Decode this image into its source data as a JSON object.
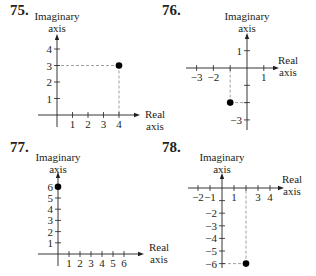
{
  "chart_data": [
    {
      "type": "scatter",
      "number": "75.",
      "title": "",
      "xlabel": "Real axis",
      "ylabel": "Imaginary axis",
      "x_ticks": [
        1,
        2,
        3,
        4
      ],
      "y_ticks": [
        1,
        2,
        3,
        4
      ],
      "x_tick_labels": [
        "1",
        "2",
        "3",
        "4"
      ],
      "y_tick_labels": [
        "1",
        "2",
        "3",
        "4"
      ],
      "xlim": [
        0,
        4.5
      ],
      "ylim": [
        0,
        4.5
      ],
      "points": [
        {
          "x": 4,
          "y": 3
        }
      ],
      "guides": true,
      "grid": false
    },
    {
      "type": "scatter",
      "number": "76.",
      "title": "",
      "xlabel": "Real axis",
      "ylabel": "Imaginary axis",
      "x_ticks": [
        -3,
        -2,
        -1,
        1
      ],
      "y_ticks": [
        1,
        -1,
        -2,
        -3
      ],
      "x_tick_labels": [
        "−3",
        "−2",
        "",
        "1"
      ],
      "y_tick_labels": [
        "1",
        "",
        "",
        "−3"
      ],
      "xlim": [
        -3.5,
        1.5
      ],
      "ylim": [
        -3.5,
        1.5
      ],
      "points": [
        {
          "x": -1,
          "y": -2
        }
      ],
      "guides": true,
      "grid": false
    },
    {
      "type": "scatter",
      "number": "77.",
      "title": "",
      "xlabel": "Real axis",
      "ylabel": "Imaginary axis",
      "x_ticks": [
        1,
        2,
        3,
        4,
        5,
        6
      ],
      "y_ticks": [
        1,
        2,
        3,
        4,
        5,
        6
      ],
      "x_tick_labels": [
        "1",
        "2",
        "3",
        "4",
        "5",
        "6"
      ],
      "y_tick_labels": [
        "1",
        "2",
        "3",
        "4",
        "5",
        "6"
      ],
      "xlim": [
        0,
        6.5
      ],
      "ylim": [
        0,
        6.5
      ],
      "points": [
        {
          "x": 0,
          "y": 6
        }
      ],
      "guides": false,
      "grid": false
    },
    {
      "type": "scatter",
      "number": "78.",
      "title": "",
      "xlabel": "Real axis",
      "ylabel": "Imaginary axis",
      "x_ticks": [
        -2,
        -1,
        1,
        2,
        3,
        4
      ],
      "y_ticks": [
        -1,
        -2,
        -3,
        -4,
        -5,
        -6
      ],
      "x_tick_labels": [
        "−2",
        "−1",
        "1",
        "",
        "3",
        "4"
      ],
      "y_tick_labels": [
        "",
        "−2",
        "−3",
        "−4",
        "−5",
        "−6"
      ],
      "xlim": [
        -2.5,
        4.5
      ],
      "ylim": [
        -6.5,
        0.5
      ],
      "points": [
        {
          "x": 2,
          "y": -6
        }
      ],
      "guides": true,
      "grid": false
    }
  ],
  "panels": [
    {
      "number": "75.",
      "ylabel_line1": "Imaginary",
      "ylabel_line2": "axis",
      "xlabel_line1": "Real",
      "xlabel_line2": "axis"
    },
    {
      "number": "76.",
      "ylabel_line1": "Imaginary",
      "ylabel_line2": "axis",
      "xlabel_line1": "Real",
      "xlabel_line2": "axis"
    },
    {
      "number": "77.",
      "ylabel_line1": "Imaginary",
      "ylabel_line2": "axis",
      "xlabel_line1": "Real",
      "xlabel_line2": "axis"
    },
    {
      "number": "78.",
      "ylabel_line1": "Imaginary",
      "ylabel_line2": "axis",
      "xlabel_line1": "Real",
      "xlabel_line2": "axis"
    }
  ],
  "layout": [
    {
      "ox": 57,
      "oy": 115,
      "sx": 15.5,
      "sy": 16.5,
      "num_x": 10,
      "num_y": 4,
      "ylab_x": 57,
      "ylab_y": 22,
      "xlab_x": 145,
      "xlab_y": 118,
      "xmin_px": 38,
      "xmax_px": 136,
      "ymin_px": 127,
      "ymax_px": 38
    },
    {
      "ox": 247,
      "oy": 68,
      "sx": 16.8,
      "sy": 17.3,
      "num_x": 162,
      "num_y": 4,
      "ylab_x": 247,
      "ylab_y": 22,
      "xlab_x": 278,
      "xlab_y": 64,
      "xmin_px": 186,
      "xmax_px": 275,
      "ymin_px": 130,
      "ymax_px": 37
    },
    {
      "ox": 58,
      "oy": 254,
      "sx": 11.0,
      "sy": 11.2,
      "num_x": 10,
      "num_y": 140,
      "ylab_x": 58,
      "ylab_y": 163,
      "xlab_x": 149,
      "xlab_y": 251,
      "xmin_px": 38,
      "xmax_px": 140,
      "ymin_px": 266,
      "ymax_px": 176
    },
    {
      "ox": 222,
      "oy": 188,
      "sx": 12.0,
      "sy": 12.6,
      "num_x": 162,
      "num_y": 140,
      "ylab_x": 222,
      "ylab_y": 163,
      "xlab_x": 282,
      "xlab_y": 183,
      "xmin_px": 188,
      "xmax_px": 280,
      "ymin_px": 268,
      "ymax_px": 177
    }
  ]
}
